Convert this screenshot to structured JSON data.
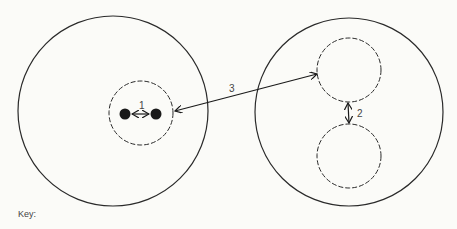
{
  "diagram": {
    "labels": {
      "distance_1": "1",
      "distance_2": "2",
      "distance_3": "3"
    },
    "key_label": "Key:"
  },
  "colors": {
    "line": "#2a2a2a",
    "background": "#fbfbf8"
  }
}
